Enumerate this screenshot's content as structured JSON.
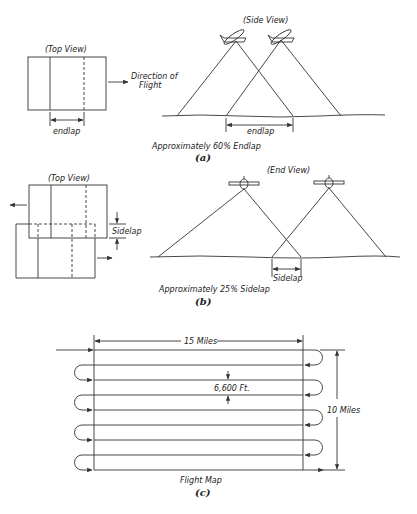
{
  "figure_a": {
    "top_view_label": "(Top View)",
    "direction_label_line1": "Direction of",
    "direction_label_line2": "Flight",
    "endlap_label_top": "endlap",
    "side_view_label": "(Side View)",
    "endlap_label_side": "endlap",
    "caption": "Approximately 60% Endlap",
    "letter": "(a)"
  },
  "figure_b": {
    "top_view_label": "(Top View)",
    "sidelap_label_top": "Sidelap",
    "end_view_label": "(End View)",
    "sidelap_label_end": "Sidelap",
    "caption": "Approximately 25% Sidelap",
    "letter": "(b)"
  },
  "figure_c": {
    "width_label": "15 Miles",
    "height_label": "10 Miles",
    "spacing_label": "6,600 Ft.",
    "caption": "Flight Map",
    "letter": "(c)",
    "flight_lines": 9
  },
  "colors": {
    "ink": "#333333",
    "background": "#ffffff"
  }
}
